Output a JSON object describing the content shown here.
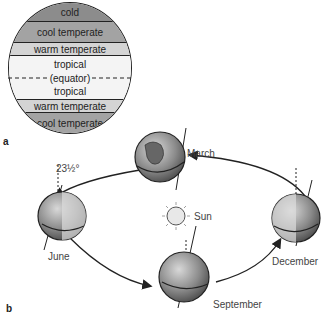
{
  "panel_a": {
    "label": "a",
    "zones": [
      {
        "name": "cold",
        "height": 19,
        "color": "#8c8c8c"
      },
      {
        "name": "cool temperate",
        "height": 21,
        "color": "#a3a3a3"
      },
      {
        "name": "warm temperate",
        "height": 13,
        "color": "#d4d4d4"
      },
      {
        "name": "tropical",
        "height": 17,
        "color": "#f4f4f4"
      },
      {
        "name": "(equator)",
        "height": 10,
        "color": "#f4f4f4"
      },
      {
        "name": "tropical",
        "height": 17,
        "color": "#f4f4f4"
      },
      {
        "name": "warm temperate",
        "height": 13,
        "color": "#d4d4d4"
      },
      {
        "name": "cool temperate",
        "height": 21,
        "color": "#a3a3a3"
      },
      {
        "name": "cold",
        "height": 18,
        "color": "#8c8c8c"
      }
    ]
  },
  "panel_b": {
    "label": "b",
    "tilt_label": "23½°",
    "sun_label": "Sun",
    "months": {
      "march": "March",
      "june": "June",
      "september": "September",
      "december": "December"
    }
  }
}
